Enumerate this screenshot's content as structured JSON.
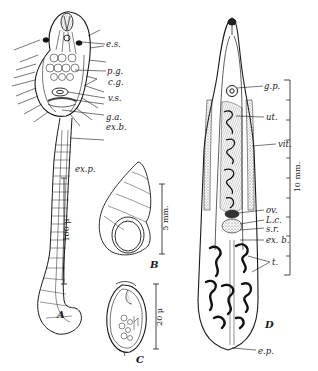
{
  "figure_a": {
    "letter": "A",
    "labels": {
      "es": "e.s.",
      "pg": "p.g.",
      "cg": "c.g.",
      "vs": "v.s.",
      "ga": "g.a.",
      "exb": "ex.b.",
      "exp": "ex.p."
    },
    "scale": "100 μ"
  },
  "figure_b": {
    "letter": "B",
    "scale": "5 mm."
  },
  "figure_c": {
    "letter": "C",
    "scale": "20 μ"
  },
  "figure_d": {
    "letter": "D",
    "labels": {
      "gp": "g.p.",
      "ut": "ut.",
      "vit": "vit.",
      "ov": "ov.",
      "lc": "L.c.",
      "sr": "s.r.",
      "exb": "ex. b.",
      "t": "t.",
      "ep": "e.p."
    },
    "scale": "10 mm."
  },
  "colors": {
    "ink": "#1a1a1a",
    "background": "#ffffff",
    "stipple": "#8a8a8a"
  }
}
